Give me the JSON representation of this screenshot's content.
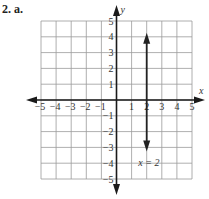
{
  "problem": {
    "label": "2. a."
  },
  "chart_data": {
    "type": "line",
    "title": "",
    "xlabel": "x",
    "ylabel": "y",
    "xlim": [
      -5,
      5
    ],
    "ylim": [
      -5,
      5
    ],
    "grid": true,
    "x_ticks": [
      -5,
      -4,
      -3,
      -2,
      -1,
      1,
      2,
      3,
      4,
      5
    ],
    "y_ticks": [
      5,
      4,
      3,
      2,
      1,
      -1,
      -2,
      -3,
      -4,
      -5
    ],
    "x_tick_labels": [
      "−5",
      "−4",
      "−3",
      "−2",
      "−1",
      "1",
      "2",
      "3",
      "4",
      "5"
    ],
    "y_tick_labels": [
      "5",
      "4",
      "3",
      "2",
      "1",
      "−1",
      "−2",
      "−3",
      "−4",
      "−5"
    ],
    "series": [
      {
        "name": "x = 2",
        "equation": "x = 2",
        "kind": "vertical line with arrows at both ends",
        "x": [
          2,
          2
        ],
        "y": [
          4,
          -3
        ]
      }
    ],
    "annotations": [
      {
        "text": "x = 2",
        "x": 2.1,
        "y": -4
      }
    ]
  }
}
